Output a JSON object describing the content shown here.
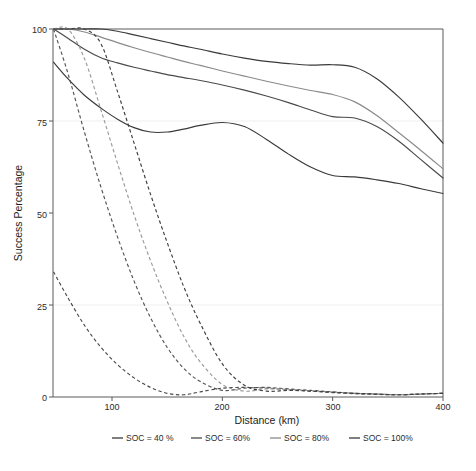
{
  "chart_data": {
    "type": "line",
    "title": "",
    "xlabel": "Distance (km)",
    "ylabel": "Success Percentage",
    "xlim": [
      47,
      400
    ],
    "ylim": [
      0,
      100
    ],
    "xticks": [
      100,
      200,
      300,
      400
    ],
    "xtick_labels": [
      "100",
      "200",
      "300",
      "400"
    ],
    "yticks": [
      0,
      25,
      50,
      75,
      100
    ],
    "ytick_labels": [
      "0",
      "25",
      "50",
      "75",
      "100"
    ],
    "grid": false,
    "legend_position": "below",
    "legend_entries": [
      "SOC = 40 %",
      "SOC = 60%",
      "SOC = 80%",
      "SOC = 100%"
    ],
    "x": [
      47,
      60,
      75,
      90,
      105,
      120,
      135,
      150,
      165,
      180,
      200,
      220,
      240,
      260,
      280,
      300,
      320,
      340,
      360,
      380,
      400
    ],
    "series": [
      {
        "name": "SOC = 40 % (solid)",
        "style": "solid",
        "color": "#3a3a3a",
        "values": [
          91.0,
          86.5,
          82.0,
          78.5,
          75.5,
          73.2,
          72.0,
          72.0,
          72.8,
          73.8,
          74.6,
          73.5,
          70.0,
          66.0,
          62.5,
          60.2,
          59.8,
          59.0,
          58.0,
          56.6,
          55.3
        ]
      },
      {
        "name": "SOC = 60% (solid)",
        "style": "solid",
        "color": "#4a4a4a",
        "values": [
          100.0,
          97.5,
          94.5,
          92.2,
          90.8,
          89.6,
          88.6,
          87.6,
          86.8,
          86.0,
          84.8,
          83.4,
          81.8,
          80.0,
          78.0,
          76.2,
          75.8,
          73.5,
          69.5,
          64.5,
          59.5
        ]
      },
      {
        "name": "SOC = 80% (solid)",
        "style": "solid",
        "color": "#8a8a8a",
        "values": [
          100.0,
          100.0,
          99.2,
          97.8,
          96.3,
          94.9,
          93.6,
          92.4,
          91.2,
          90.1,
          88.6,
          87.2,
          85.8,
          84.5,
          83.3,
          82.2,
          80.2,
          76.5,
          71.8,
          67.0,
          62.0
        ]
      },
      {
        "name": "SOC = 100% (solid)",
        "style": "solid",
        "color": "#3a3a3a",
        "values": [
          100.0,
          100.0,
          100.0,
          100.0,
          99.4,
          98.4,
          97.4,
          96.4,
          95.4,
          94.5,
          93.2,
          92.1,
          91.2,
          90.6,
          90.2,
          90.3,
          89.6,
          86.5,
          81.5,
          75.5,
          69.0
        ]
      },
      {
        "name": "SOC = 40 % (dashed)",
        "style": "dashed",
        "color": "#4a4a4a",
        "values": [
          34.0,
          27.0,
          19.5,
          13.5,
          8.8,
          5.2,
          2.6,
          1.0,
          0.6,
          1.4,
          2.4,
          2.6,
          2.4,
          2.0,
          1.6,
          1.2,
          0.9,
          0.7,
          0.6,
          0.8,
          1.0
        ]
      },
      {
        "name": "SOC = 60% (dashed)",
        "style": "dashed",
        "color": "#555555",
        "values": [
          100.0,
          88.0,
          72.0,
          57.0,
          43.5,
          31.5,
          21.5,
          13.5,
          7.8,
          4.2,
          1.8,
          2.4,
          2.6,
          2.2,
          1.8,
          1.4,
          1.0,
          0.8,
          0.6,
          0.8,
          1.0
        ]
      },
      {
        "name": "SOC = 80% (dashed)",
        "style": "dashed",
        "color": "#9a9a9a",
        "values": [
          100.0,
          100.0,
          92.0,
          78.0,
          63.5,
          49.5,
          37.0,
          26.0,
          16.5,
          9.5,
          3.4,
          1.6,
          2.2,
          2.0,
          1.7,
          1.3,
          1.0,
          0.8,
          0.6,
          0.8,
          1.0
        ]
      },
      {
        "name": "SOC = 100% (dashed)",
        "style": "dashed",
        "color": "#3f3f3f",
        "values": [
          100.0,
          100.0,
          100.0,
          96.0,
          83.0,
          69.0,
          55.0,
          42.0,
          30.0,
          20.0,
          9.0,
          3.2,
          1.6,
          1.8,
          1.6,
          1.3,
          1.0,
          0.8,
          0.6,
          0.8,
          1.0
        ]
      }
    ]
  },
  "axes": {
    "y_title": "Success Percentage",
    "x_title": "Distance (km)",
    "ytick_0": "0",
    "ytick_25": "25",
    "ytick_50": "50",
    "ytick_75": "75",
    "ytick_100": "100",
    "xtick_100": "100",
    "xtick_200": "200",
    "xtick_300": "300",
    "xtick_400": "400"
  },
  "legend": {
    "items": [
      {
        "label": "SOC = 40 %",
        "color": "#3a3a3a"
      },
      {
        "label": "SOC = 60%",
        "color": "#4a4a4a"
      },
      {
        "label": "SOC = 80%",
        "color": "#8a8a8a"
      },
      {
        "label": "SOC = 100%",
        "color": "#3a3a3a"
      }
    ]
  },
  "colors": {
    "background": "#ffffff",
    "frame": "#5a5a5a",
    "text": "#2b2b2b"
  }
}
